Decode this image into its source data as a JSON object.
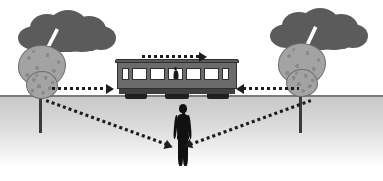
{
  "scene": {
    "title": "Train and lightning simultaneity diagram",
    "width": 383,
    "height": 181,
    "background_color": "#ffffff"
  },
  "colors": {
    "cloud": "#5b5b5b",
    "tree_crown": "#a3a3a3",
    "tree_trunk": "#3a3a3a",
    "train_body": "#6b6b6b",
    "train_roof": "#5a5a5a",
    "train_window": "#ffffff",
    "train_undercarriage": "#3f3f3f",
    "wheels": "#1f1f1f",
    "person": "#111111",
    "lightning": "#ffffff",
    "ground_near": "#c9c9c9",
    "ground_far": "#ffffff",
    "ground_line": "#7a7a7a",
    "arrow": "#1d1d1d"
  },
  "ground": {
    "label": "ground",
    "horizon_y": 95
  },
  "clouds": [
    {
      "id": "cloud-left",
      "label": "storm cloud left",
      "side": "left"
    },
    {
      "id": "cloud-right",
      "label": "storm cloud right",
      "side": "right"
    }
  ],
  "lightning_strikes": [
    {
      "id": "lightning-left",
      "label": "lightning strike A",
      "side": "left",
      "color": "#ffffff"
    },
    {
      "id": "lightning-right",
      "label": "lightning strike B",
      "side": "right",
      "color": "#ffffff"
    }
  ],
  "trees": [
    {
      "id": "tree-left",
      "label": "struck tree left",
      "side": "left"
    },
    {
      "id": "tree-right",
      "label": "struck tree right",
      "side": "right"
    }
  ],
  "train": {
    "label": "passenger rail car",
    "direction": "right",
    "window_count": 7,
    "windows": [
      {
        "type": "small"
      },
      {
        "type": "big"
      },
      {
        "type": "big"
      },
      {
        "type": "mid",
        "has_passenger": true
      },
      {
        "type": "big"
      },
      {
        "type": "big"
      },
      {
        "type": "small"
      }
    ],
    "passenger": {
      "label": "observer inside train"
    },
    "bogies": 3
  },
  "person": {
    "label": "observer standing on the ground",
    "silhouette_color": "#111111"
  },
  "arrows": [
    {
      "id": "arrow-train-motion",
      "label": "train direction of motion",
      "style": "dotted",
      "direction": "right",
      "position": "above train"
    },
    {
      "id": "arrow-light-left",
      "label": "light signal from left strike travelling right",
      "style": "dotted",
      "direction": "right",
      "position": "left of train, along horizon"
    },
    {
      "id": "arrow-light-right",
      "label": "light signal from right strike travelling left",
      "style": "dotted",
      "direction": "left",
      "position": "right of train, along horizon"
    },
    {
      "id": "ray-left-to-observer",
      "label": "light ray from left strike to ground observer",
      "style": "dotted",
      "direction": "down-right",
      "position": "left tree base to person"
    },
    {
      "id": "ray-right-to-observer",
      "label": "light ray from right strike to ground observer",
      "style": "dotted",
      "direction": "down-left",
      "position": "right tree base to person"
    }
  ]
}
